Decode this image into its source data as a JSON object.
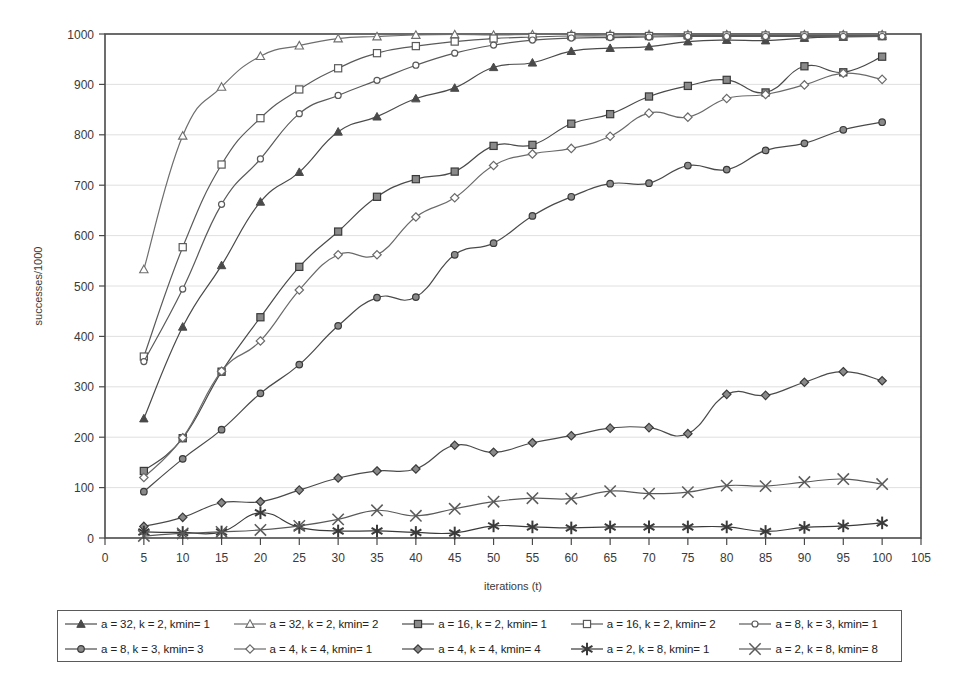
{
  "chart_data": {
    "type": "line",
    "title": "",
    "xlabel": "iterations (t)",
    "ylabel": "successes/1000",
    "xlim": [
      0,
      105
    ],
    "ylim": [
      0,
      1000
    ],
    "xticks": [
      0,
      5,
      10,
      15,
      20,
      25,
      30,
      35,
      40,
      45,
      50,
      55,
      60,
      65,
      70,
      75,
      80,
      85,
      90,
      95,
      100,
      105
    ],
    "yticks": [
      0,
      100,
      200,
      300,
      400,
      500,
      600,
      700,
      800,
      900,
      1000
    ],
    "grid": "horizontal",
    "legend_position": "bottom",
    "legend_columns": 5,
    "x": [
      5,
      10,
      15,
      20,
      25,
      30,
      35,
      40,
      45,
      50,
      55,
      60,
      65,
      70,
      75,
      80,
      85,
      90,
      95,
      100
    ],
    "series": [
      {
        "name": "a = 32, k = 2, kmin= 1",
        "marker": "filled-triangle",
        "color": "#4a4a4a",
        "values": [
          237,
          419,
          541,
          667,
          726,
          806,
          836,
          872,
          893,
          934,
          943,
          966,
          972,
          975,
          985,
          988,
          987,
          992,
          994,
          995
        ]
      },
      {
        "name": "a = 32, k = 2, kmin= 2",
        "marker": "open-triangle",
        "color": "#6e6e6e",
        "values": [
          533,
          798,
          895,
          956,
          977,
          991,
          995,
          998,
          999,
          998,
          999,
          999,
          999,
          999,
          999,
          999,
          999,
          999,
          999,
          999
        ]
      },
      {
        "name": "a = 16, k = 2, kmin= 1",
        "marker": "filled-square",
        "color": "#4a4a4a",
        "values": [
          133,
          198,
          330,
          438,
          538,
          608,
          677,
          712,
          727,
          778,
          780,
          822,
          841,
          876,
          897,
          909,
          884,
          936,
          924,
          955
        ]
      },
      {
        "name": "a = 16, k = 2, kmin= 2",
        "marker": "open-square",
        "color": "#5a5a5a",
        "values": [
          360,
          577,
          741,
          833,
          890,
          932,
          962,
          976,
          985,
          991,
          994,
          996,
          996,
          996,
          997,
          997,
          997,
          997,
          997,
          997
        ]
      },
      {
        "name": "a = 8, k = 3, kmin= 1",
        "marker": "small-circle",
        "color": "#5a5a5a",
        "values": [
          350,
          494,
          662,
          752,
          842,
          878,
          908,
          938,
          962,
          978,
          988,
          992,
          993,
          994,
          995,
          995,
          995,
          995,
          995,
          995
        ]
      },
      {
        "name": "a = 8, k = 3, kmin= 3",
        "marker": "filled-circle",
        "color": "#4a4a4a",
        "values": [
          92,
          157,
          215,
          287,
          344,
          421,
          477,
          478,
          562,
          585,
          639,
          677,
          703,
          704,
          739,
          731,
          769,
          783,
          810,
          825
        ]
      },
      {
        "name": "a = 4, k = 4, kmin= 1",
        "marker": "open-diamond",
        "color": "#6a6a6a",
        "values": [
          120,
          199,
          331,
          391,
          492,
          562,
          562,
          637,
          675,
          739,
          762,
          773,
          797,
          843,
          835,
          872,
          880,
          899,
          922,
          910
        ]
      },
      {
        "name": "a = 4, k = 4, kmin= 4",
        "marker": "filled-diamond",
        "color": "#4a4a4a",
        "values": [
          23,
          41,
          70,
          72,
          95,
          119,
          133,
          137,
          184,
          170,
          189,
          203,
          218,
          219,
          207,
          285,
          283,
          309,
          330,
          312
        ]
      },
      {
        "name": "a = 2, k = 8, kmin= 1",
        "marker": "bold-asterisk",
        "color": "#3a3a3a",
        "values": [
          12,
          11,
          12,
          50,
          21,
          14,
          14,
          11,
          10,
          24,
          22,
          20,
          22,
          22,
          22,
          22,
          13,
          21,
          24,
          30
        ]
      },
      {
        "name": "a = 2, k = 8, kmin= 8",
        "marker": "thin-cross",
        "color": "#5a5a5a",
        "values": [
          4,
          9,
          12,
          16,
          24,
          37,
          55,
          44,
          58,
          72,
          79,
          78,
          93,
          88,
          91,
          104,
          103,
          111,
          117,
          107
        ]
      }
    ]
  },
  "axes": {
    "ylabel": "successes/1000",
    "xlabel": "iterations (t)"
  }
}
